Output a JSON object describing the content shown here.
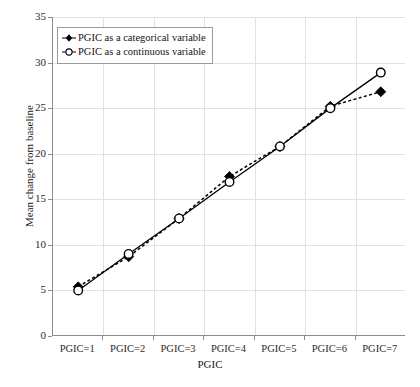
{
  "chart_data": {
    "type": "line",
    "title": "",
    "xlabel": "PGIC",
    "ylabel": "Mean change from baseline",
    "categories": [
      "PGIC=1",
      "PGIC=2",
      "PGIC=3",
      "PGIC=4",
      "PGIC=5",
      "PGIC=6",
      "PGIC=7"
    ],
    "x": [
      1,
      2,
      3,
      4,
      5,
      6,
      7
    ],
    "xlim": [
      0.5,
      7.5
    ],
    "ylim": [
      0,
      35
    ],
    "yticks": [
      0,
      5,
      10,
      15,
      20,
      25,
      30,
      35
    ],
    "ytick_labels": [
      "0",
      "5",
      "10",
      "15",
      "20",
      "25",
      "30",
      "35"
    ],
    "grid": true,
    "legend_position": "upper left",
    "series": [
      {
        "name": "PGIC as a categorical variable",
        "values": [
          5.4,
          8.7,
          12.9,
          17.5,
          20.8,
          25.2,
          26.8
        ],
        "marker": "filled-diamond",
        "linestyle": "dashed",
        "color": "#000000"
      },
      {
        "name": "PGIC as a continuous variable",
        "values": [
          5.0,
          9.0,
          12.9,
          16.9,
          20.8,
          25.0,
          28.9
        ],
        "marker": "open-circle",
        "linestyle": "solid",
        "color": "#000000"
      }
    ]
  },
  "legend": {
    "items": [
      {
        "label": "PGIC as a categorical variable"
      },
      {
        "label": "PGIC as a continuous variable"
      }
    ]
  },
  "colors": {
    "axis": "#8c8c8c",
    "grid": "#e2e2e2",
    "line": "#000000",
    "background": "#ffffff"
  }
}
